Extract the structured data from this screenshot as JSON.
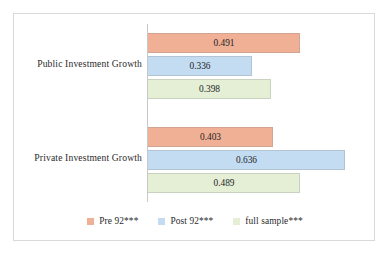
{
  "chart_data": {
    "type": "bar",
    "orientation": "horizontal",
    "title": "",
    "subtitle": "",
    "xlabel": "",
    "ylabel": "",
    "categories": [
      "Public Investment Growth",
      "Private Investment Growth"
    ],
    "series": [
      {
        "name": "Pre 92***",
        "color": "#F0B096",
        "values": [
          0.491,
          0.403
        ],
        "labels": [
          "0.491",
          "0.403"
        ]
      },
      {
        "name": "Post 92***",
        "color": "#C3DCF2",
        "values": [
          0.336,
          0.636
        ],
        "labels": [
          "0.336",
          "0.636"
        ]
      },
      {
        "name": "full sample***",
        "color": "#E4EFD6",
        "values": [
          0.398,
          0.489
        ],
        "labels": [
          "0.398",
          "0.489"
        ]
      }
    ],
    "xlim": [
      0,
      0.7
    ],
    "grid": false,
    "legend_position": "bottom",
    "data_labels": true,
    "axis_line_color": "#c8c8c8",
    "plot_border_color": "#d9d9d9",
    "background_color": "#ffffff"
  }
}
